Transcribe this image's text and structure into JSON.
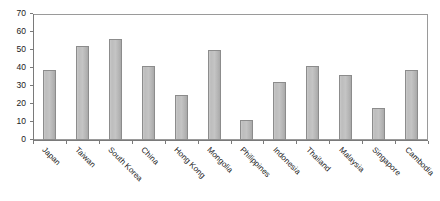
{
  "chart_data": {
    "type": "bar",
    "title": "",
    "subtitle": "",
    "xlabel": "",
    "ylabel": "",
    "ylim": [
      0,
      70
    ],
    "ytick_step": 10,
    "yticks": [
      0,
      10,
      20,
      30,
      40,
      50,
      60,
      70
    ],
    "ytick_labels": [
      "0",
      "10",
      "20",
      "30",
      "40",
      "50",
      "60",
      "70"
    ],
    "grid": false,
    "legend": null,
    "legend_position": "none",
    "bar_color": "#c2c2c2",
    "bar_edge_color": "#8c8c8c",
    "axis_color": "#7a7a7a",
    "categories": [
      "Japan",
      "Taiwan",
      "South Korea",
      "China",
      "Hong Kong",
      "Mongolia",
      "Philippines",
      "Indonesia",
      "Thailand",
      "Malaysia",
      "Singapore",
      "Cambodia"
    ],
    "values": [
      39,
      52,
      56,
      41,
      25,
      50,
      11,
      32,
      41,
      36,
      18,
      39
    ],
    "series": [
      {
        "name": "",
        "values": [
          39,
          52,
          56,
          41,
          25,
          50,
          11,
          32,
          41,
          36,
          18,
          39
        ]
      }
    ]
  }
}
